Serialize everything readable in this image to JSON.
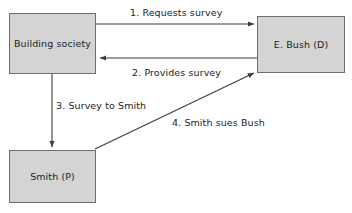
{
  "diagram": {
    "type": "flow-diagram",
    "colors": {
      "node_fill": "#d4d4d4",
      "node_border": "#6e6e6e",
      "edge": "#3c3c3c",
      "text": "#1d1d1d",
      "background": "#ffffff"
    },
    "nodes": [
      {
        "id": "building-society",
        "label": "Building society"
      },
      {
        "id": "bush",
        "label": "E. Bush (D)"
      },
      {
        "id": "smith",
        "label": "Smith (P)"
      }
    ],
    "edges": [
      {
        "id": "edge-1",
        "label": "1. Requests survey",
        "from": "building-society",
        "to": "bush",
        "direction": "right"
      },
      {
        "id": "edge-2",
        "label": "2. Provides survey",
        "from": "bush",
        "to": "building-society",
        "direction": "left"
      },
      {
        "id": "edge-3",
        "label": "3. Survey to Smith",
        "from": "building-society",
        "to": "smith",
        "direction": "down"
      },
      {
        "id": "edge-4",
        "label": "4. Smith sues Bush",
        "from": "smith",
        "to": "bush",
        "direction": "up-right"
      }
    ]
  }
}
